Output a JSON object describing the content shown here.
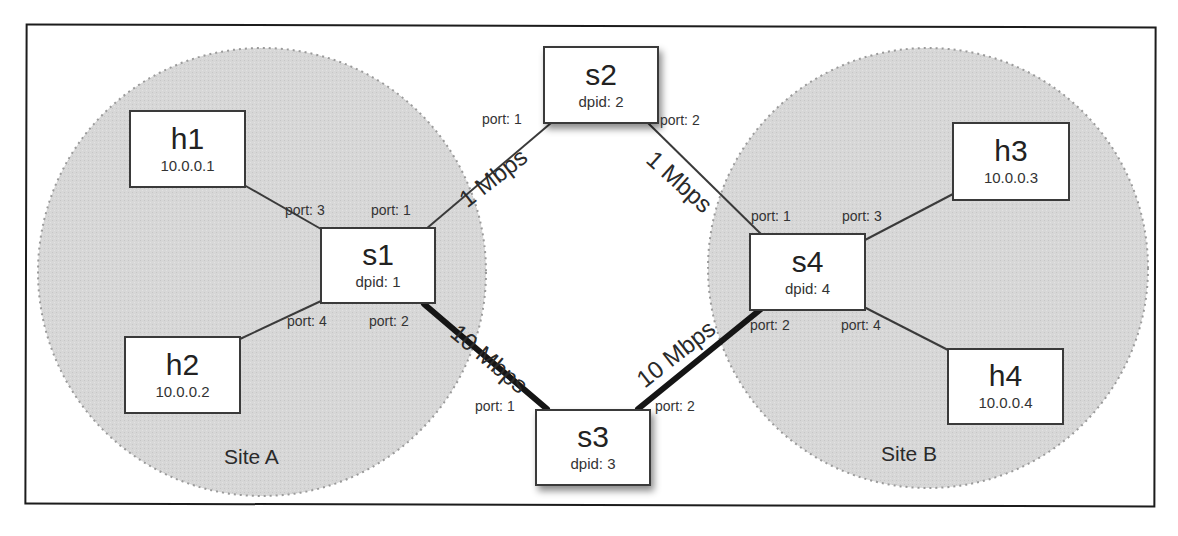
{
  "diagram": {
    "type": "network-topology",
    "sites": [
      {
        "id": "site-a",
        "label": "Site A"
      },
      {
        "id": "site-b",
        "label": "Site B"
      }
    ],
    "hosts": [
      {
        "id": "h1",
        "name": "h1",
        "ip": "10.0.0.1"
      },
      {
        "id": "h2",
        "name": "h2",
        "ip": "10.0.0.2"
      },
      {
        "id": "h3",
        "name": "h3",
        "ip": "10.0.0.3"
      },
      {
        "id": "h4",
        "name": "h4",
        "ip": "10.0.0.4"
      }
    ],
    "switches": [
      {
        "id": "s1",
        "name": "s1",
        "dpid": "dpid: 1"
      },
      {
        "id": "s2",
        "name": "s2",
        "dpid": "dpid: 2"
      },
      {
        "id": "s3",
        "name": "s3",
        "dpid": "dpid: 3"
      },
      {
        "id": "s4",
        "name": "s4",
        "dpid": "dpid: 4"
      }
    ],
    "ports": {
      "s1_p3": "port: 3",
      "s1_p1": "port: 1",
      "s1_p4": "port: 4",
      "s1_p2": "port: 2",
      "s2_p1": "port: 1",
      "s2_p2": "port: 2",
      "s3_p1": "port: 1",
      "s3_p2": "port: 2",
      "s4_p1": "port: 1",
      "s4_p3": "port: 3",
      "s4_p2": "port: 2",
      "s4_p4": "port: 4"
    },
    "links": [
      {
        "from": "h1",
        "to": "s1",
        "bandwidth": ""
      },
      {
        "from": "h2",
        "to": "s1",
        "bandwidth": ""
      },
      {
        "from": "s1",
        "to": "s2",
        "bandwidth": "1 Mbps"
      },
      {
        "from": "s2",
        "to": "s4",
        "bandwidth": "1 Mbps"
      },
      {
        "from": "s1",
        "to": "s3",
        "bandwidth": "10 Mbps"
      },
      {
        "from": "s3",
        "to": "s4",
        "bandwidth": "10 Mbps"
      },
      {
        "from": "s4",
        "to": "h3",
        "bandwidth": ""
      },
      {
        "from": "s4",
        "to": "h4",
        "bandwidth": ""
      }
    ],
    "colors": {
      "site_fill": "#d6d6d6",
      "site_border": "#9a9a9a",
      "node_border": "#3a3a3a",
      "thin_link": "#3a3a3a",
      "thick_link": "#151515"
    }
  }
}
